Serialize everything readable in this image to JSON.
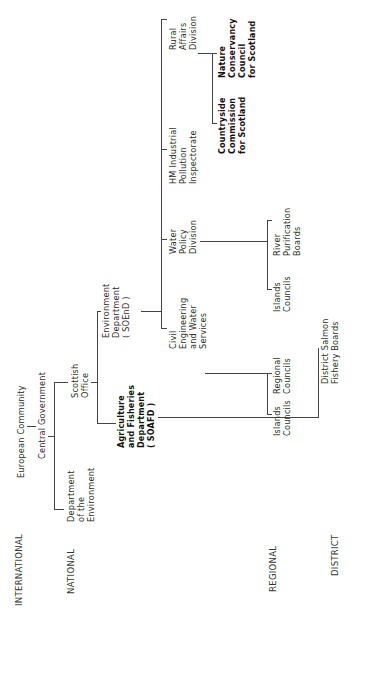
{
  "levels": {
    "international": "INTERNATIONAL",
    "national": "NATIONAL",
    "regional": "REGIONAL",
    "district": "DISTRICT"
  },
  "nodes": {
    "european_community": "European Community",
    "central_government": "Central Government",
    "dept_environment": "Department\nof the\nEnvironment",
    "scottish_office": "Scottish\nOffice",
    "soafd": "Agriculture\nand Fisheries\nDepartment\n( SOAFD )",
    "soend": "Environment\nDepartment\n( SOEnD )",
    "civil_engineering": "Civil\nEngineering\nand Water\nServices",
    "water_policy": "Water\nPolicy\nDivision",
    "hm_industrial": "HM Industrial\nPollution\nInspectorate",
    "rural_affairs": "Rural\nAffairs\nDivision",
    "countryside_commission": "Countryside\nCommission\nfor Scotland",
    "nature_conservancy": "Nature\nConservancy\nCouncil\nfor Scotland",
    "islands_councils_1": "Islands\nCouncils",
    "regional_councils": "Regional\nCouncils",
    "islands_councils_2": "Islands\nCouncils",
    "river_purification": "River\nPurification\nBoards",
    "district_salmon": "District Salmon\nFishery Boards"
  },
  "colors": {
    "line": "#444444",
    "text": "#2b2b2b",
    "background": "#ffffff"
  }
}
